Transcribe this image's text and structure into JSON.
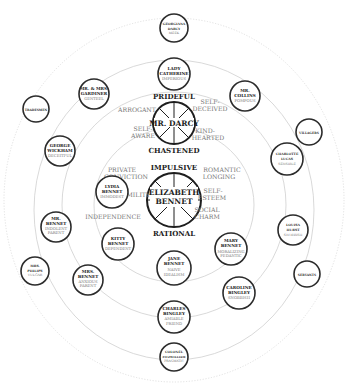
{
  "diagram": {
    "center": {
      "name_line1": "ELIZABETH",
      "name_line2": "BENNET",
      "top_label": "IMPULSIVE",
      "bottom_label": "RATIONAL",
      "left_traits": [
        "PRIVATE",
        "CONVICTION",
        "HUMILITY",
        "INDEPENDENCE"
      ],
      "right_traits": [
        "ROMANTIC",
        "LONGING",
        "SELF-",
        "ESTEEM",
        "SOCIAL",
        "CHARM"
      ]
    },
    "darcy": {
      "name": "MR. DARCY",
      "top_label": "PRIDEFUL",
      "bottom_label": "CHASTENED",
      "left_traits": [
        "ARROGANT",
        "SELF-",
        "AWARE"
      ],
      "right_traits": [
        "SELF-",
        "DECEIVED",
        "KIND-",
        "HEARTED"
      ]
    },
    "characters": [
      {
        "id": "georgiana",
        "lines": [
          "GEORGIANA",
          "DARCY"
        ],
        "trait": [
          "MEEK"
        ]
      },
      {
        "id": "lady-catherine",
        "lines": [
          "LADY",
          "CATHERINE"
        ],
        "trait": [
          "IMPERIOUS"
        ]
      },
      {
        "id": "gardiner",
        "lines": [
          "MR. & MRS.",
          "GARDINER"
        ],
        "trait": [
          "GENTEEL"
        ]
      },
      {
        "id": "collins",
        "lines": [
          "MR.",
          "COLLINS"
        ],
        "trait": [
          "POMPOUS"
        ]
      },
      {
        "id": "tradesmen",
        "lines": [
          "TRADESMEN"
        ],
        "trait": []
      },
      {
        "id": "villagers",
        "lines": [
          "VILLAGERS"
        ],
        "trait": []
      },
      {
        "id": "wickham",
        "lines": [
          "GEORGE",
          "WICKHAM"
        ],
        "trait": [
          "DECEITFUL"
        ]
      },
      {
        "id": "charlotte",
        "lines": [
          "CHARLOTTE",
          "LUCAS"
        ],
        "trait": [
          "SENSIBLE"
        ]
      },
      {
        "id": "lydia",
        "lines": [
          "LYDIA",
          "BENNET"
        ],
        "trait": [
          "IMMODEST"
        ]
      },
      {
        "id": "mr-bennet",
        "lines": [
          "MR.",
          "BENNET"
        ],
        "trait": [
          "INDOLENT",
          "PARENT"
        ]
      },
      {
        "id": "louisa",
        "lines": [
          "LOUISA",
          "HURST"
        ],
        "trait": [
          "SNOBBISH"
        ]
      },
      {
        "id": "kitty",
        "lines": [
          "KITTY",
          "BENNET"
        ],
        "trait": [
          "DEPENDENT"
        ]
      },
      {
        "id": "mary",
        "lines": [
          "MARY",
          "BENNET"
        ],
        "trait": [
          "MORALIZING",
          "PEDANTIC"
        ]
      },
      {
        "id": "jane",
        "lines": [
          "JANE",
          "BENNET"
        ],
        "trait": [
          "NAIVE",
          "IDEALISM"
        ]
      },
      {
        "id": "philips",
        "lines": [
          "MRS.",
          "PHILIPS"
        ],
        "trait": [
          "VULGAR"
        ]
      },
      {
        "id": "mrs-bennet",
        "lines": [
          "MRS.",
          "BENNET"
        ],
        "trait": [
          "ANXIOUS",
          "PARENT"
        ]
      },
      {
        "id": "servants",
        "lines": [
          "SERVANTS"
        ],
        "trait": []
      },
      {
        "id": "caroline",
        "lines": [
          "CAROLINE",
          "BINGLEY"
        ],
        "trait": [
          "SNOBBISH"
        ]
      },
      {
        "id": "charles",
        "lines": [
          "CHARLES",
          "BINGLEY"
        ],
        "trait": [
          "AMIABLE",
          "FRIEND"
        ]
      },
      {
        "id": "fitzwilliam",
        "lines": [
          "COLONEL",
          "FITZWILLIAM"
        ],
        "trait": [
          "PRAGMATIC"
        ]
      }
    ]
  }
}
